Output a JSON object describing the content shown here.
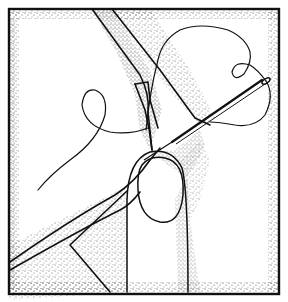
{
  "illustration": {
    "subject": "Hand threading a needle through folded fabric",
    "elements": [
      "frame-border",
      "fabric-fold",
      "thread",
      "needle",
      "fingertip",
      "stipple-shading"
    ],
    "colors": {
      "ink": "#111111",
      "paper": "#ffffff",
      "stipple": "#333333"
    }
  }
}
